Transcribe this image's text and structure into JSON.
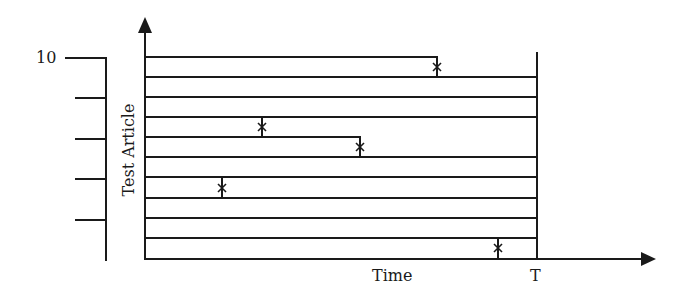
{
  "diagram": {
    "y_axis_label": "Test Article",
    "x_axis_label": "Time",
    "end_time_label": "T",
    "top_count_label": "10",
    "stroke_color": "#1a1a1a",
    "background_color": "#ffffff",
    "failure_marker": "x",
    "articles": [
      {
        "index": 10,
        "status": "failed",
        "failure_time_fraction": 0.75
      },
      {
        "index": 9,
        "status": "survived_to_T"
      },
      {
        "index": 8,
        "status": "survived_to_T"
      },
      {
        "index": 7,
        "status": "failed",
        "failure_time_fraction": 0.3
      },
      {
        "index": 6,
        "status": "failed",
        "failure_time_fraction": 0.55
      },
      {
        "index": 5,
        "status": "survived_to_T"
      },
      {
        "index": 4,
        "status": "failed",
        "failure_time_fraction": 0.2
      },
      {
        "index": 3,
        "status": "survived_to_T"
      },
      {
        "index": 2,
        "status": "survived_to_T"
      },
      {
        "index": 1,
        "status": "failed",
        "failure_time_fraction": 0.9
      }
    ],
    "left_scale_ticks": 5
  }
}
